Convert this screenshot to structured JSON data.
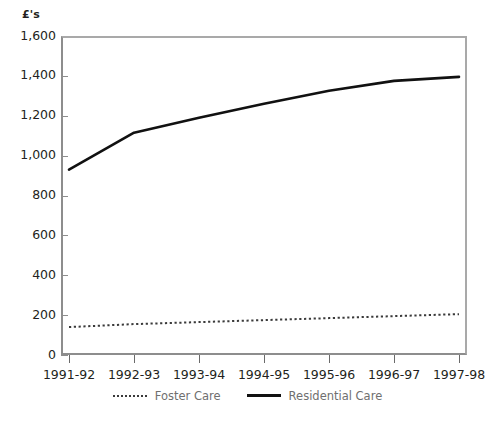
{
  "chart_data": {
    "type": "line",
    "title": "",
    "subtitle": "",
    "xlabel": "",
    "ylabel": "£'s",
    "categories": [
      "1991-92",
      "1992-93",
      "1993-94",
      "1994-95",
      "1995-96",
      "1996-97",
      "1997-98"
    ],
    "ylim": [
      0,
      1600
    ],
    "ytick_labels": [
      "0",
      "200",
      "400",
      "600",
      "800",
      "1,000",
      "1,200",
      "1,400",
      "1,600"
    ],
    "ytick_values": [
      0,
      200,
      400,
      600,
      800,
      1000,
      1200,
      1400,
      1600
    ],
    "grid": false,
    "legend_position": "bottom",
    "series": [
      {
        "name": "Foster Care",
        "style": "dotted",
        "color": "#3a3a3a",
        "values": [
          140,
          155,
          165,
          175,
          185,
          195,
          205
        ]
      },
      {
        "name": "Residential Care",
        "style": "solid",
        "color": "#111111",
        "values": [
          930,
          1115,
          1190,
          1260,
          1325,
          1375,
          1395
        ]
      }
    ]
  },
  "legend": {
    "entries": [
      {
        "label": "Foster Care",
        "marker": "dotted-line-icon"
      },
      {
        "label": "Residential Care",
        "marker": "solid-line-icon"
      }
    ]
  },
  "footer": {
    "ghost_text": ""
  }
}
